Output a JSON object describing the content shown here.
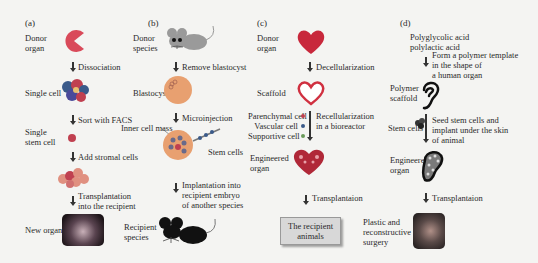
{
  "panels": {
    "a": {
      "label": "(a)",
      "donor": "Donor organ",
      "donor_l1": "Donor",
      "donor_l2": "organ",
      "step1": "Dissociation",
      "single_cell": "Single cell",
      "step2": "Sort with FACS",
      "single_stem_l1": "Single",
      "single_stem_l2": "stem cell",
      "step3": "Add stromal cells",
      "step4_l1": "Transplantation",
      "step4_l2": "into the recipient",
      "result": "New organ"
    },
    "b": {
      "label": "(b)",
      "donor_l1": "Donor",
      "donor_l2": "species",
      "step1": "Remove blastocyst",
      "blastocyst": "Blastocyst",
      "step2": "Microinjection",
      "inner_cell_mass": "Inner cell mass",
      "stem_cells": "Stem cells",
      "step3_l1": "Implantation into",
      "step3_l2": "recipient embryo",
      "step3_l3": "of another species",
      "result_l1": "Recipient",
      "result_l2": "species"
    },
    "c": {
      "label": "(c)",
      "donor_l1": "Donor",
      "donor_l2": "organ",
      "step1": "Decellularization",
      "scaffold": "Scaffold",
      "cells": [
        "Parenchymal cell",
        "Vascular cell",
        "Supportive cell"
      ],
      "step2_l1": "Recellularization",
      "step2_l2": "in a bioreactor",
      "engineered_l1": "Engineered",
      "engineered_l2": "organ",
      "step3": "Transplantaion",
      "result_l1": "The recipient",
      "result_l2": "animals"
    },
    "d": {
      "label": "(d)",
      "material_l1": "Polyglycolic acid",
      "material_l2": "polylactic acid",
      "step1_l1": "Form a polymer template",
      "step1_l2": "in the shape of",
      "step1_l3": "a human organ",
      "scaffold_l1": "Polymer",
      "scaffold_l2": "scaffold",
      "stem_cells": "Stem cells",
      "step2_l1": "Seed stem cells and",
      "step2_l2": "implant under the skin",
      "step2_l3": "of animal",
      "engineered_l1": "Engineered",
      "engineered_l2": "organ",
      "step3": "Transplantaion",
      "result_l1": "Plastic and",
      "result_l2": "reconstructive",
      "result_l3": "surgery"
    }
  },
  "colors": {
    "organ": "#d94a5a",
    "heart": "#c8283c",
    "cell_red": "#b03040",
    "blastocyst": "#e8a070",
    "mouse_gray": "#a0a0a0",
    "box": "#d8d8d8"
  }
}
